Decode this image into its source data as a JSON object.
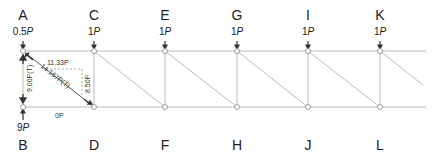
{
  "top_nodes": [
    {
      "id": "A",
      "x": 23,
      "load": "0.5",
      "unit": "P"
    },
    {
      "id": "C",
      "x": 94,
      "load": "1",
      "unit": "P"
    },
    {
      "id": "E",
      "x": 165,
      "load": "1",
      "unit": "P"
    },
    {
      "id": "G",
      "x": 237,
      "load": "1",
      "unit": "P"
    },
    {
      "id": "I",
      "x": 308,
      "load": "1",
      "unit": "P"
    },
    {
      "id": "K",
      "x": 380,
      "load": "1",
      "unit": "P"
    }
  ],
  "bottom_nodes": [
    {
      "id": "B",
      "x": 23
    },
    {
      "id": "D",
      "x": 94
    },
    {
      "id": "F",
      "x": 165
    },
    {
      "id": "H",
      "x": 237
    },
    {
      "id": "J",
      "x": 308
    },
    {
      "id": "L",
      "x": 380
    }
  ],
  "support_reaction": {
    "node": "B",
    "value": "9",
    "unit": "P"
  },
  "member_forces": {
    "AB": "9.00P(T)",
    "AD": "14.167P(T)",
    "AD_horizontal_component": "11.33P",
    "AD_vertical_component": "8.50P",
    "BD": "0P"
  },
  "colors": {
    "member": "#bbbbbb",
    "text": "#222222",
    "dashed": "#999999"
  }
}
